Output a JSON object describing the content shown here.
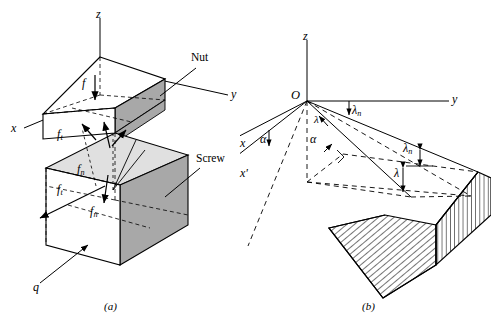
{
  "figure": {
    "width": 491,
    "height": 326,
    "background": "#ffffff",
    "line_color": "#000000",
    "fill_dark": "#a8a8a8",
    "fill_light": "#d8d8d8",
    "fill_white": "#ffffff"
  },
  "panel_a": {
    "caption": "(a)",
    "axes": {
      "z": "z",
      "y": "y",
      "x": "x"
    },
    "labels": {
      "nut": "Nut",
      "screw": "Screw",
      "force_f": "f",
      "force_ft_upper_base": "f",
      "force_ft_upper_sub": "t",
      "force_fn_upper_base": "f",
      "force_fn_upper_sub": "n",
      "force_ft_lower_base": "f",
      "force_ft_lower_sub": "t",
      "force_fn_lower_base": "f",
      "force_fn_lower_sub": "n",
      "q": "q"
    }
  },
  "panel_b": {
    "caption": "(b)",
    "axes": {
      "z": "z",
      "y": "y",
      "origin": "O",
      "x": "x",
      "x_prime": "x'"
    },
    "angles": {
      "alpha_left": "α",
      "alpha_center": "α",
      "lambda_n_top_base": "λ",
      "lambda_n_top_sub": "n",
      "lambda_n_right_base": "λ",
      "lambda_n_right_sub": "n",
      "lambda_right": "λ",
      "lambda_center": "λ"
    }
  }
}
